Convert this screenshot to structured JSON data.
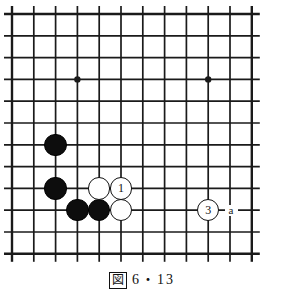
{
  "figure": {
    "kind": "go-board-diagram",
    "caption_badge": "図",
    "caption_text": "6・13"
  },
  "board": {
    "columns": 12,
    "rows": 12,
    "spacing": 21.8,
    "origin_x": 12,
    "origin_y": 14,
    "line_color": "#1a1a1a",
    "edge_line_width": 2.4,
    "inner_line_width": 1.7,
    "background": "#ffffff",
    "overhang": 8,
    "star_points": [
      {
        "col": 3,
        "row": 3
      },
      {
        "col": 9,
        "row": 3
      },
      {
        "col": 3,
        "row": 9
      },
      {
        "col": 9,
        "row": 9
      }
    ]
  },
  "stones": [
    {
      "id": "black-1",
      "color": "black",
      "col": 2,
      "row": 6,
      "label": ""
    },
    {
      "id": "black-2",
      "color": "black",
      "col": 2,
      "row": 8,
      "label": ""
    },
    {
      "id": "black-3",
      "color": "black",
      "col": 3,
      "row": 9,
      "label": ""
    },
    {
      "id": "black-4",
      "color": "black",
      "col": 4,
      "row": 9,
      "label": ""
    },
    {
      "id": "white-1",
      "color": "white",
      "col": 4,
      "row": 8,
      "label": ""
    },
    {
      "id": "white-move-1",
      "color": "white",
      "col": 5,
      "row": 8,
      "label": "1"
    },
    {
      "id": "white-2",
      "color": "white",
      "col": 5,
      "row": 9,
      "label": ""
    },
    {
      "id": "white-move-3",
      "color": "white",
      "col": 9,
      "row": 9,
      "label": "3"
    }
  ],
  "point_labels": [
    {
      "id": "label-a",
      "text": "a",
      "col": 10,
      "row": 9
    }
  ],
  "colors": {
    "black_stone": "#0d0d0d",
    "white_stone": "#ffffff",
    "stone_outline": "#111111",
    "grid": "#1a1a1a",
    "paper": "#ffffff"
  }
}
